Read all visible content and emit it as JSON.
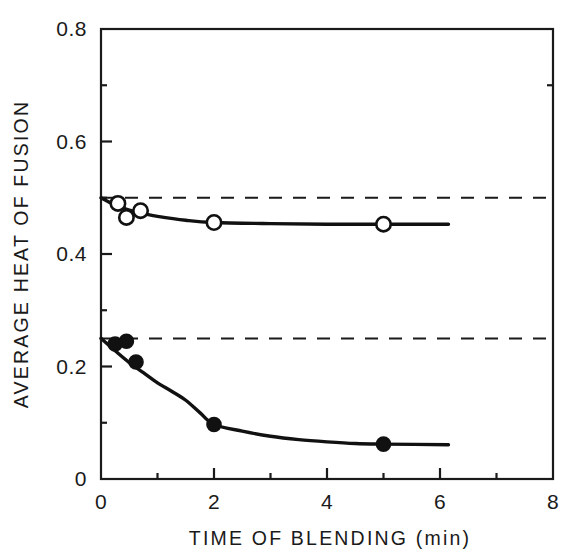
{
  "chart_data": {
    "type": "line",
    "title": "",
    "subtitle": "",
    "xlabel": "TIME OF BLENDING  (min)",
    "ylabel": "AVERAGE HEAT OF FUSION",
    "xlim": [
      0,
      8
    ],
    "ylim": [
      0,
      0.8
    ],
    "grid": false,
    "legend": null,
    "x_ticks_major": [
      "0",
      "2",
      "4",
      "6",
      "8"
    ],
    "x_tick_values_major": [
      0,
      2,
      4,
      6,
      8
    ],
    "x_tick_values_minor": [
      1,
      3,
      5,
      7
    ],
    "y_ticks_major": [
      "0",
      "0.2",
      "0.4",
      "0.6",
      "0.8"
    ],
    "y_tick_values_major": [
      0,
      0.2,
      0.4,
      0.6,
      0.8
    ],
    "y_tick_values_minor": [
      0.1,
      0.3,
      0.5,
      0.7
    ],
    "series": [
      {
        "name": "upper-open-circles",
        "marker": "open-circle",
        "line": "solid",
        "color": "#111111",
        "points": [
          {
            "x": 0.3,
            "y": 0.49
          },
          {
            "x": 0.45,
            "y": 0.465
          },
          {
            "x": 0.7,
            "y": 0.477
          },
          {
            "x": 2.0,
            "y": 0.456
          },
          {
            "x": 5.0,
            "y": 0.453
          }
        ],
        "fit_curve": [
          {
            "x": 0.0,
            "y": 0.5
          },
          {
            "x": 0.25,
            "y": 0.487
          },
          {
            "x": 0.5,
            "y": 0.478
          },
          {
            "x": 0.75,
            "y": 0.472
          },
          {
            "x": 1.0,
            "y": 0.467
          },
          {
            "x": 1.5,
            "y": 0.46
          },
          {
            "x": 2.0,
            "y": 0.456
          },
          {
            "x": 3.0,
            "y": 0.454
          },
          {
            "x": 4.0,
            "y": 0.453
          },
          {
            "x": 5.0,
            "y": 0.453
          },
          {
            "x": 6.15,
            "y": 0.453
          }
        ],
        "asymptote": 0.5
      },
      {
        "name": "lower-filled-circles",
        "marker": "filled-circle",
        "line": "solid",
        "color": "#111111",
        "points": [
          {
            "x": 0.25,
            "y": 0.24
          },
          {
            "x": 0.45,
            "y": 0.245
          },
          {
            "x": 0.62,
            "y": 0.208
          },
          {
            "x": 2.0,
            "y": 0.097
          },
          {
            "x": 5.0,
            "y": 0.062
          }
        ],
        "fit_curve": [
          {
            "x": 0.0,
            "y": 0.25
          },
          {
            "x": 0.25,
            "y": 0.228
          },
          {
            "x": 0.5,
            "y": 0.207
          },
          {
            "x": 0.75,
            "y": 0.189
          },
          {
            "x": 1.0,
            "y": 0.171
          },
          {
            "x": 1.25,
            "y": 0.156
          },
          {
            "x": 1.5,
            "y": 0.14
          },
          {
            "x": 1.75,
            "y": 0.118
          },
          {
            "x": 2.0,
            "y": 0.097
          },
          {
            "x": 2.5,
            "y": 0.085
          },
          {
            "x": 3.0,
            "y": 0.076
          },
          {
            "x": 3.5,
            "y": 0.07
          },
          {
            "x": 4.0,
            "y": 0.066
          },
          {
            "x": 4.5,
            "y": 0.063
          },
          {
            "x": 5.0,
            "y": 0.062
          },
          {
            "x": 6.15,
            "y": 0.061
          }
        ],
        "asymptote": 0.25
      }
    ],
    "reference_lines": [
      {
        "name": "upper-dashed-asymptote",
        "y": 0.5,
        "style": "dashed"
      },
      {
        "name": "lower-dashed-asymptote",
        "y": 0.25,
        "style": "dashed"
      }
    ]
  }
}
